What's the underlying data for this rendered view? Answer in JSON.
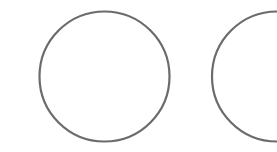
{
  "canvas": {
    "width": 277,
    "height": 152,
    "background": "#ffffff"
  },
  "shapes": [
    {
      "type": "circle",
      "name": "circle-left",
      "cx": 104.5,
      "cy": 76.5,
      "r": 65,
      "stroke": "#6b6b6b",
      "stroke_width": 2.2,
      "fill": "none"
    },
    {
      "type": "circle",
      "name": "circle-right",
      "cx": 277,
      "cy": 76.5,
      "r": 65,
      "stroke": "#6b6b6b",
      "stroke_width": 2.2,
      "fill": "none"
    }
  ]
}
